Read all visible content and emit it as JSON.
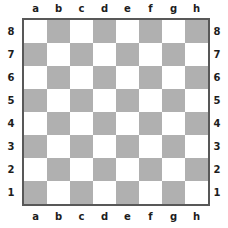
{
  "board": {
    "title": "Empty chessboard",
    "orientation": "white-bottom",
    "files": [
      "a",
      "b",
      "c",
      "d",
      "e",
      "f",
      "g",
      "h"
    ],
    "ranks": [
      "8",
      "7",
      "6",
      "5",
      "4",
      "3",
      "2",
      "1"
    ],
    "size": 8,
    "colors": {
      "light_square": "#ffffff",
      "dark_square": "#b0b0b0",
      "border": "#585858",
      "label_text": "#1d1d1d",
      "background": "#ffffff"
    },
    "square_colors": [
      [
        "light",
        "dark",
        "light",
        "dark",
        "light",
        "dark",
        "light",
        "dark"
      ],
      [
        "dark",
        "light",
        "dark",
        "light",
        "dark",
        "light",
        "dark",
        "light"
      ],
      [
        "light",
        "dark",
        "light",
        "dark",
        "light",
        "dark",
        "light",
        "dark"
      ],
      [
        "dark",
        "light",
        "dark",
        "light",
        "dark",
        "light",
        "dark",
        "light"
      ],
      [
        "light",
        "dark",
        "light",
        "dark",
        "light",
        "dark",
        "light",
        "dark"
      ],
      [
        "dark",
        "light",
        "dark",
        "light",
        "dark",
        "light",
        "dark",
        "light"
      ],
      [
        "light",
        "dark",
        "light",
        "dark",
        "light",
        "dark",
        "light",
        "dark"
      ],
      [
        "dark",
        "light",
        "dark",
        "light",
        "dark",
        "light",
        "dark",
        "light"
      ]
    ],
    "pieces": []
  }
}
